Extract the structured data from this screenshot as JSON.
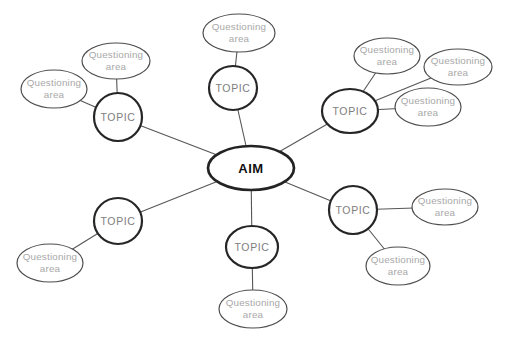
{
  "diagram": {
    "type": "mind-map",
    "background": "#ffffff",
    "styles": {
      "line_color": "#565656",
      "line_width": 1.1,
      "aim_stroke": "#232323",
      "aim_stroke_width": 2.7,
      "topic_stroke": "#262626",
      "topic_stroke_width": 2.2,
      "question_stroke": "#4d4d4d",
      "question_stroke_width": 1.2,
      "node_fill": "#ffffff",
      "aim_text_color": "#101010",
      "topic_text_color": "#7d7d7d",
      "question_text_color": "#a8a8a8",
      "aim_font_size": 13,
      "topic_font_size": 10.5,
      "question_font_size": 9.8,
      "question_line_height": 12
    },
    "aim": {
      "id": "aim",
      "label": "AIM",
      "x": 251,
      "y": 168,
      "rx": 43,
      "ry": 22
    },
    "topics": [
      {
        "id": "topic-top",
        "label": "TOPIC",
        "x": 233,
        "y": 88,
        "rx": 24,
        "ry": 22
      },
      {
        "id": "topic-upper-left",
        "label": "TOPIC",
        "x": 118,
        "y": 117,
        "rx": 24,
        "ry": 24
      },
      {
        "id": "topic-upper-right",
        "label": "TOPIC",
        "x": 350,
        "y": 111,
        "rx": 28,
        "ry": 22
      },
      {
        "id": "topic-lower-right",
        "label": "TOPIC",
        "x": 353,
        "y": 210,
        "rx": 24,
        "ry": 24
      },
      {
        "id": "topic-bottom",
        "label": "TOPIC",
        "x": 252,
        "y": 247,
        "rx": 26,
        "ry": 21
      },
      {
        "id": "topic-lower-left",
        "label": "TOPIC",
        "x": 118,
        "y": 221,
        "rx": 24,
        "ry": 23
      }
    ],
    "questioning_areas": [
      {
        "id": "q-top",
        "parent": "topic-top",
        "label": "Questioning area",
        "lines": [
          "Questioning",
          "area"
        ],
        "x": 239,
        "y": 33,
        "rx": 36,
        "ry": 19
      },
      {
        "id": "q-upper-left-a",
        "parent": "topic-upper-left",
        "label": "Questioning area",
        "lines": [
          "Questioning",
          "area"
        ],
        "x": 116,
        "y": 61,
        "rx": 34,
        "ry": 18
      },
      {
        "id": "q-upper-left-b",
        "parent": "topic-upper-left",
        "label": "Questioning area",
        "lines": [
          "Questioning",
          "area"
        ],
        "x": 54,
        "y": 89,
        "rx": 33,
        "ry": 19
      },
      {
        "id": "q-upper-right-a",
        "parent": "topic-upper-right",
        "label": "Questioning area",
        "lines": [
          "Questioning",
          "area"
        ],
        "x": 387,
        "y": 56,
        "rx": 33,
        "ry": 18
      },
      {
        "id": "q-upper-right-b",
        "parent": "topic-upper-right",
        "label": "Questioning area",
        "lines": [
          "Questioning",
          "area"
        ],
        "x": 458,
        "y": 67,
        "rx": 34,
        "ry": 18
      },
      {
        "id": "q-upper-right-c",
        "parent": "topic-upper-right",
        "label": "Questioning area",
        "lines": [
          "Questioning",
          "area"
        ],
        "x": 428,
        "y": 107,
        "rx": 33,
        "ry": 19
      },
      {
        "id": "q-lower-right-a",
        "parent": "topic-lower-right",
        "label": "Questioning area",
        "lines": [
          "Questioning",
          "area"
        ],
        "x": 445,
        "y": 207,
        "rx": 33,
        "ry": 18
      },
      {
        "id": "q-lower-right-b",
        "parent": "topic-lower-right",
        "label": "Questioning area",
        "lines": [
          "Questioning",
          "area"
        ],
        "x": 398,
        "y": 266,
        "rx": 32,
        "ry": 19
      },
      {
        "id": "q-bottom",
        "parent": "topic-bottom",
        "label": "Questioning area",
        "lines": [
          "Questioning",
          "area"
        ],
        "x": 253,
        "y": 309,
        "rx": 34,
        "ry": 19
      },
      {
        "id": "q-lower-left",
        "parent": "topic-lower-left",
        "label": "Questioning area",
        "lines": [
          "Questioning",
          "area"
        ],
        "x": 50,
        "y": 263,
        "rx": 33,
        "ry": 19
      }
    ]
  }
}
